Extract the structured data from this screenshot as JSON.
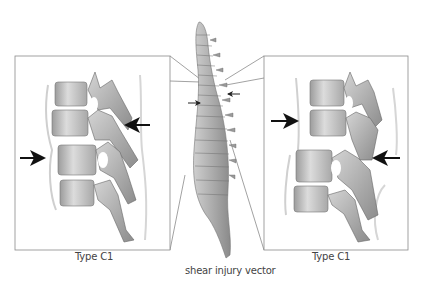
{
  "figure": {
    "center": {
      "label": "shear injury vector",
      "arrows": [
        "right-arrow-left-side",
        "left-arrow-right-side"
      ]
    },
    "left_panel": {
      "label": "Type C1",
      "arrows": [
        {
          "direction": "left",
          "position": "upper-right"
        },
        {
          "direction": "right",
          "position": "middle-left"
        }
      ]
    },
    "right_panel": {
      "label": "Type C1",
      "arrows": [
        {
          "direction": "right",
          "position": "upper-left"
        },
        {
          "direction": "left",
          "position": "lower-right"
        }
      ]
    },
    "colors": {
      "line": "#8a8a8a",
      "bone_light": "#e2e2e2",
      "bone_mid": "#b8b8b8",
      "bone_dark": "#7a7a7a",
      "arrow": "#111111"
    }
  }
}
